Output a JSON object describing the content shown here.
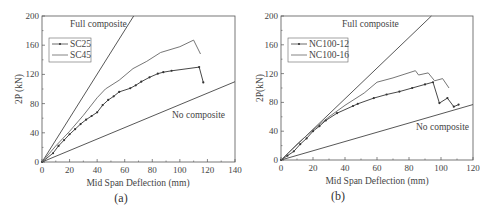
{
  "chart_data": [
    {
      "type": "line",
      "caption": "(a)",
      "xlabel": "Mid Span Deflection (mm)",
      "ylabel": "2P (kN)",
      "xlim": [
        0,
        140
      ],
      "ylim": [
        0,
        200
      ],
      "xticks": [
        0,
        20,
        40,
        60,
        80,
        100,
        120,
        140
      ],
      "yticks": [
        0,
        40,
        80,
        120,
        160,
        200
      ],
      "grid": false,
      "legend_position": "upper-left",
      "annotations": [
        "Full composite",
        "No composite"
      ],
      "reference_lines": [
        {
          "name": "Full composite",
          "x": [
            0,
            66.5
          ],
          "y": [
            0,
            200
          ]
        },
        {
          "name": "No composite",
          "x": [
            0,
            140
          ],
          "y": [
            0,
            110
          ]
        }
      ],
      "series": [
        {
          "name": "SC25",
          "marker": "dot",
          "x": [
            0,
            8,
            12,
            16,
            20,
            24,
            28,
            32,
            36,
            40,
            44,
            48,
            52,
            56,
            64,
            68,
            72,
            78,
            84,
            88,
            94,
            114,
            117
          ],
          "y": [
            0,
            12,
            22,
            30,
            38,
            45,
            52,
            58,
            63,
            68,
            78,
            85,
            90,
            96,
            101,
            105,
            110,
            116,
            121,
            123,
            125,
            130,
            109
          ]
        },
        {
          "name": "SC45",
          "marker": "none",
          "x": [
            0,
            10,
            20,
            30,
            40,
            46,
            56,
            66,
            76,
            86,
            100,
            110,
            115
          ],
          "y": [
            0,
            22,
            42,
            64,
            88,
            100,
            112,
            128,
            138,
            150,
            158,
            167,
            148
          ]
        }
      ]
    },
    {
      "type": "line",
      "caption": "(b)",
      "xlabel": "Mid Span Deflection (mm)",
      "ylabel": "2P(kN)",
      "xlim": [
        0,
        120
      ],
      "ylim": [
        0,
        200
      ],
      "xticks": [
        0,
        20,
        40,
        60,
        80,
        100,
        120
      ],
      "yticks": [
        0,
        40,
        80,
        120,
        160,
        200
      ],
      "grid": false,
      "legend_position": "upper-left",
      "annotations": [
        "Full composite",
        "No composite"
      ],
      "reference_lines": [
        {
          "name": "Full composite",
          "x": [
            0,
            94
          ],
          "y": [
            0,
            200
          ]
        },
        {
          "name": "No composite",
          "x": [
            0,
            120
          ],
          "y": [
            0,
            77
          ]
        }
      ],
      "series": [
        {
          "name": "NC100-12",
          "marker": "dot",
          "x": [
            0,
            4,
            8,
            12,
            16,
            20,
            24,
            28,
            35,
            45,
            48,
            58,
            66,
            74,
            82,
            90,
            95,
            99,
            104,
            108,
            111
          ],
          "y": [
            0,
            6,
            12,
            22,
            30,
            40,
            47,
            55,
            65,
            75,
            78,
            86,
            91,
            95,
            100,
            105,
            108,
            79,
            86,
            74,
            77
          ]
        },
        {
          "name": "NC100-16",
          "marker": "none",
          "x": [
            0,
            10,
            20,
            30,
            40,
            52,
            60,
            70,
            84,
            86,
            92,
            96,
            101,
            105
          ],
          "y": [
            0,
            22,
            42,
            60,
            76,
            93,
            108,
            114,
            124,
            118,
            121,
            110,
            113,
            100
          ]
        }
      ]
    }
  ],
  "charts": [
    {
      "caption": "(a)",
      "xlabel": "Mid Span Deflection (mm)",
      "ylabel": "2P (kN)",
      "xticks": [
        "0",
        "20",
        "40",
        "60",
        "80",
        "100",
        "120",
        "140"
      ],
      "yticks": [
        "0",
        "40",
        "80",
        "120",
        "160",
        "200"
      ],
      "legend": [
        "SC25",
        "SC45"
      ],
      "full_label": "Full composite",
      "no_label": "No composite"
    },
    {
      "caption": "(b)",
      "xlabel": "Mid Span Deflection (mm)",
      "ylabel": "2P(kN)",
      "xticks": [
        "0",
        "20",
        "40",
        "60",
        "80",
        "100",
        "120"
      ],
      "yticks": [
        "0",
        "40",
        "80",
        "120",
        "160",
        "200"
      ],
      "legend": [
        "NC100-12",
        "NC100-16"
      ],
      "full_label": "Full composite",
      "no_label": "No composite"
    }
  ],
  "colors": {
    "line": "#444444",
    "axis": "#555555",
    "text": "#444444"
  }
}
